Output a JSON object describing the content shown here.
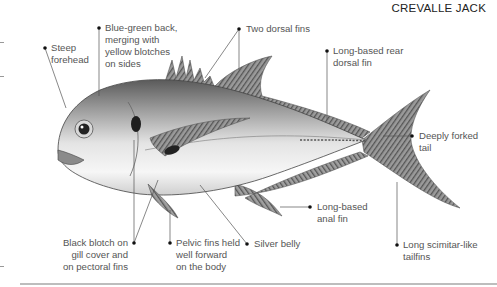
{
  "title": "CREVALLE JACK",
  "labels": {
    "steep_forehead": "Steep\nforehead",
    "blue_green_back": "Blue-green back,\nmerging with\nyellow blotches\non sides",
    "two_dorsal_fins": "Two dorsal fins",
    "rear_dorsal_fin": "Long-based rear\ndorsal fin",
    "forked_tail": "Deeply forked\ntail",
    "anal_fin": "Long-based\nanal fin",
    "scimitar_tailfins": "Long scimitar-like\ntailfins",
    "silver_belly": "Silver belly",
    "pelvic_fins": "Pelvic fins held\nwell forward\non the body",
    "black_blotch": "Black blotch on\ngill cover and\non pectoral fins"
  },
  "colors": {
    "leader_line": "#555555",
    "label_text": "#555555",
    "title_text": "#222222",
    "bottom_rule": "#bdbdbd"
  }
}
